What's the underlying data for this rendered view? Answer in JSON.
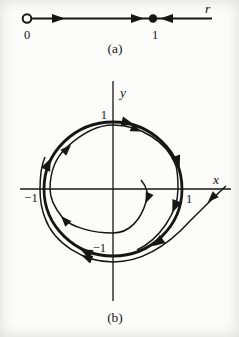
{
  "colors": {
    "ink": "#161616",
    "background": "#fcfcfb"
  },
  "figure_a": {
    "type": "one-dimensional phase line",
    "axis_label": "r",
    "origin_tick": "0",
    "unit_tick": "1",
    "caption": "(a)",
    "fixed_points": [
      {
        "location": "0",
        "style": "open-circle",
        "stability": "unstable"
      },
      {
        "location": "1",
        "style": "filled-dot",
        "stability": "stable"
      }
    ],
    "flow_arrows": [
      {
        "position": "between 0 and 1 (left)",
        "direction": "right"
      },
      {
        "position": "just left of 1",
        "direction": "right"
      },
      {
        "position": "right of 1",
        "direction": "left"
      }
    ]
  },
  "figure_b": {
    "type": "two-dimensional phase portrait with stable limit cycle",
    "x_axis_label": "x",
    "y_axis_label": "y",
    "x_tick_positive": "1",
    "x_tick_negative": "−1",
    "y_tick_positive": "1",
    "y_tick_negative": "−1",
    "caption": "(b)",
    "curves": [
      {
        "name": "limit-cycle",
        "shape": "bold unit circle",
        "flow": "clockwise"
      },
      {
        "name": "inner-trajectory",
        "shape": "spiral growing outward from near origin toward the circle",
        "flow": "clockwise"
      },
      {
        "name": "outer-trajectory",
        "shape": "spiral entering from right, wrapping inward toward the circle",
        "flow": "clockwise"
      }
    ]
  }
}
